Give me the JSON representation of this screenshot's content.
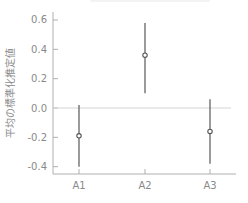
{
  "chart_data": {
    "type": "errorbar",
    "title": "",
    "xlabel": "",
    "ylabel": "平均の標準化推定値",
    "categories": [
      "A1",
      "A2",
      "A3"
    ],
    "series": [
      {
        "name": "estimate",
        "values": [
          -0.19,
          0.36,
          -0.16
        ],
        "lower": [
          -0.4,
          0.1,
          -0.38
        ],
        "upper": [
          0.02,
          0.58,
          0.06
        ]
      }
    ],
    "yticks": [
      "0.6",
      "0.4",
      "0.2",
      "0.0",
      "-0.2",
      "-0.4"
    ],
    "ytick_values": [
      0.6,
      0.4,
      0.2,
      0.0,
      -0.2,
      -0.4
    ],
    "ylim": [
      -0.46,
      0.62
    ],
    "reference_line": 0.0,
    "grid": false,
    "legend": null
  },
  "colors": {
    "axis": "#b0b0b0",
    "text": "#8a8a8a",
    "errorbar": "#707070",
    "reference": "#d4d4d4",
    "marker": "#555555"
  }
}
